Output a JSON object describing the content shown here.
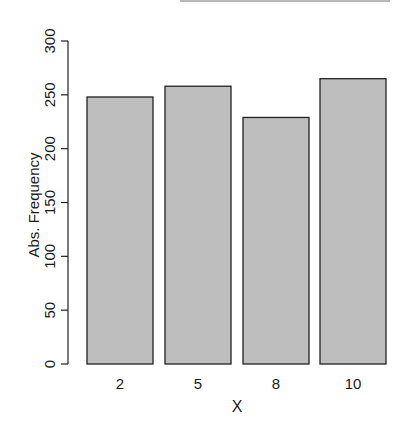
{
  "chart_data": {
    "type": "bar",
    "title": "",
    "xlabel": "X",
    "ylabel": "Abs. Frequency",
    "categories": [
      "2",
      "5",
      "8",
      "10"
    ],
    "values": [
      248,
      258,
      229,
      265
    ],
    "ylim": [
      0,
      300
    ],
    "yticks": [
      0,
      50,
      100,
      150,
      200,
      250,
      300
    ],
    "grid": false,
    "legend": null,
    "bar_color": "#bebebe",
    "border_color": "#222222"
  }
}
